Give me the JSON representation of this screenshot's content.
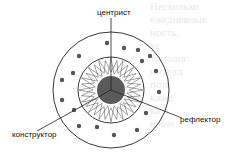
{
  "diagram": {
    "labels": {
      "top": "центрист",
      "right": "рефлектор",
      "left": "конструктор"
    },
    "colors": {
      "core": "#555555",
      "dots": "#555555",
      "lines": "#222222"
    },
    "ghost_text": [
      "Несколько",
      "ежедневные",
      "ность,",
      "ус",
      "типолог",
      "интелл",
      "поте",
      "кажд",
      "ва и",
      "имен"
    ]
  }
}
